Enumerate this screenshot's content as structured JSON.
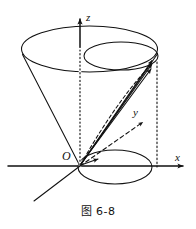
{
  "figure": {
    "caption": "图 6-8",
    "background_color": "#ffffff",
    "stroke_color": "#111111"
  },
  "axes": {
    "z_label": "z",
    "x_label": "x",
    "y_label": "y",
    "origin_label": "O"
  },
  "geometry": {
    "description": "Cone opening upward with inscribed cylinder; vectors drawn from origin to a point on the rim of the cylinder top",
    "cone_top_ellipse": {
      "cx": 89.5,
      "cy": 49,
      "rx": 68,
      "ry": 23
    },
    "cylinder_top_ellipse": {
      "cx": 121,
      "cy": 56,
      "rx": 37,
      "ry": 14
    },
    "cylinder_base_ellipse": {
      "cx": 115,
      "cy": 167,
      "rx": 37,
      "ry": 17
    },
    "apex": {
      "x": 80,
      "y": 166
    },
    "vector_target": {
      "x": 157,
      "y": 62
    },
    "z_axis": {
      "x": 80,
      "y_top": 14,
      "y_bottom": 196
    },
    "x_axis": {
      "y": 166,
      "x_left": 8,
      "x_right": 188
    },
    "y_axis_arrow_tip": {
      "x": 147,
      "y": 119
    }
  }
}
